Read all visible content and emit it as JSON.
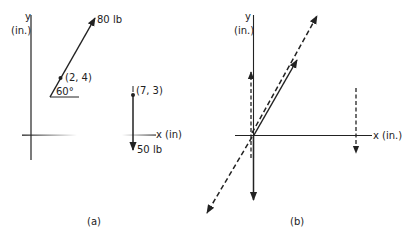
{
  "figure": {
    "panel_a": {
      "caption": "(a)",
      "y_axis_label": "y",
      "y_axis_unit": "(in.)",
      "x_axis_label": "x (in)",
      "force_1": {
        "label": "80 lb",
        "point_label": "(2, 4)",
        "angle_label": "60°"
      },
      "force_2": {
        "label": "50 lb",
        "point_label": "(7, 3)"
      }
    },
    "panel_b": {
      "caption": "(b)",
      "y_axis_label": "y",
      "y_axis_unit": "(in.)",
      "x_axis_label": "x (in.)"
    },
    "colors": {
      "ink": "#222222",
      "background": "#ffffff"
    }
  }
}
